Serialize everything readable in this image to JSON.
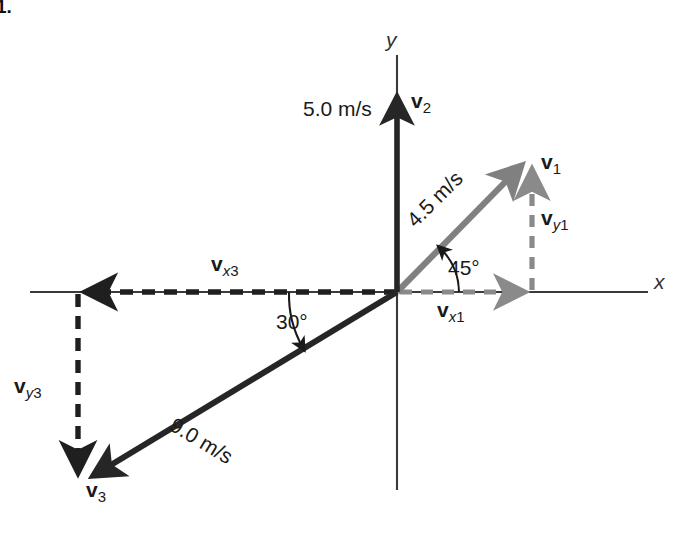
{
  "figure": {
    "item_number": "1.",
    "background": "#ffffff",
    "width": 691,
    "height": 535
  },
  "colors": {
    "axis": "#3a3a3a",
    "dark_vector": "#262626",
    "gray_vector": "#808080",
    "dashed_dark": "#1f1f1f",
    "dashed_gray": "#8a8a8a",
    "text": "#1a1a1a"
  },
  "axes": {
    "x_label": "x",
    "y_label": "y",
    "origin": {
      "x": 397,
      "y": 292
    },
    "x_start": {
      "x": 30,
      "y": 292
    },
    "x_end": {
      "x": 648,
      "y": 292
    },
    "y_top": {
      "x": 397,
      "y": 55
    },
    "y_bottom": {
      "x": 397,
      "y": 490
    }
  },
  "vectors": [
    {
      "id": "v1",
      "name": "v",
      "subscript": "1",
      "magnitude_label": "4.5 m/s",
      "angle_label": "45°",
      "color": "gray_vector",
      "style": "solid",
      "from": {
        "x": 397,
        "y": 292
      },
      "to": {
        "x": 527,
        "y": 160
      },
      "name_label_pos": {
        "x": 543,
        "y": 152
      },
      "magnitude_label_pos": {
        "x": 422,
        "y": 227
      },
      "magnitude_rotation": -45,
      "angle_label_pos": {
        "x": 449,
        "y": 258
      }
    },
    {
      "id": "v2",
      "name": "v",
      "subscript": "2",
      "magnitude_label": "5.0 m/s",
      "angle_label": "",
      "color": "dark_vector",
      "style": "solid",
      "from": {
        "x": 397,
        "y": 292
      },
      "to": {
        "x": 397,
        "y": 88
      },
      "name_label_pos": {
        "x": 413,
        "y": 91
      },
      "magnitude_label_pos": {
        "x": 303,
        "y": 97
      },
      "magnitude_rotation": 0
    },
    {
      "id": "v3",
      "name": "v",
      "subscript": "3",
      "magnitude_label": "9.0 m/s",
      "angle_label": "30°",
      "color": "dark_vector",
      "style": "solid",
      "from": {
        "x": 397,
        "y": 292
      },
      "to": {
        "x": 84,
        "y": 482
      },
      "name_label_pos": {
        "x": 88,
        "y": 482
      },
      "magnitude_label_pos": {
        "x": 183,
        "y": 424
      },
      "magnitude_rotation": 31,
      "angle_label_pos": {
        "x": 278,
        "y": 311
      }
    }
  ],
  "components": [
    {
      "id": "vx1",
      "name": "v",
      "subscript_var": "x",
      "subscript_num": "1",
      "color": "dashed_gray",
      "style": "dashed",
      "from": {
        "x": 397,
        "y": 292
      },
      "to": {
        "x": 533,
        "y": 292
      },
      "label_pos": {
        "x": 441,
        "y": 300
      }
    },
    {
      "id": "vy1",
      "name": "v",
      "subscript_var": "y",
      "subscript_num": "1",
      "color": "dashed_gray",
      "style": "dashed",
      "from": {
        "x": 532,
        "y": 292
      },
      "to": {
        "x": 532,
        "y": 162
      },
      "label_pos": {
        "x": 543,
        "y": 208
      }
    },
    {
      "id": "vx3",
      "name": "v",
      "subscript_var": "x",
      "subscript_num": "3",
      "color": "dashed_dark",
      "style": "dashed",
      "from": {
        "x": 397,
        "y": 292
      },
      "to": {
        "x": 76,
        "y": 292
      },
      "label_pos": {
        "x": 213,
        "y": 254
      }
    },
    {
      "id": "vy3",
      "name": "v",
      "subscript_var": "y",
      "subscript_num": "3",
      "color": "dashed_dark",
      "style": "dashed",
      "from": {
        "x": 78,
        "y": 292
      },
      "to": {
        "x": 78,
        "y": 482
      },
      "label_pos": {
        "x": 14,
        "y": 375
      }
    }
  ],
  "angle_arcs": [
    {
      "id": "arc-45",
      "label": "45°",
      "from_deg": 0,
      "to_deg": 45,
      "radius": 62
    },
    {
      "id": "arc-30",
      "label": "30°",
      "from_deg": 180,
      "to_deg": 211,
      "radius": 108
    }
  ]
}
